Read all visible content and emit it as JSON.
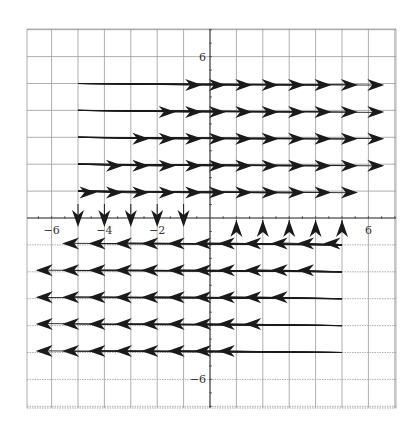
{
  "chart_data": {
    "type": "vector_field",
    "title": "",
    "xlabel": "",
    "ylabel": "",
    "xlim": [
      -7,
      7
    ],
    "ylim": [
      -7,
      7
    ],
    "grid": true,
    "x_tick_labels": [
      {
        "value": -6,
        "label": "−6"
      },
      {
        "value": -4,
        "label": "−4"
      },
      {
        "value": -2,
        "label": "−2"
      },
      {
        "value": 6,
        "label": "6"
      }
    ],
    "y_tick_labels": [
      {
        "value": 6,
        "label": "6"
      },
      {
        "value": -6,
        "label": "−6"
      }
    ],
    "rows_right": [
      {
        "y": 5,
        "tail_x": -5,
        "heads_x": [
          -0.6,
          0.3,
          1.3,
          2.3,
          3.3,
          4.3,
          5.3,
          6.3
        ]
      },
      {
        "y": 4,
        "tail_x": -5,
        "heads_x": [
          -1.6,
          -0.6,
          0.3,
          1.3,
          2.3,
          3.3,
          4.3,
          5.3,
          6.3
        ]
      },
      {
        "y": 3,
        "tail_x": -5,
        "heads_x": [
          -2.6,
          -1.6,
          -0.6,
          0.3,
          1.3,
          2.3,
          3.3,
          4.3,
          5.3,
          6.3
        ]
      },
      {
        "y": 2,
        "tail_x": -5,
        "heads_x": [
          -3.6,
          -2.6,
          -1.6,
          -0.6,
          0.3,
          1.3,
          2.3,
          3.3,
          4.3,
          5.3,
          6.3
        ]
      },
      {
        "y": 1,
        "tail_x": -5,
        "heads_x": [
          -4.6,
          -3.6,
          -2.6,
          -1.6,
          -0.6,
          0.3,
          1.3,
          2.3,
          3.3,
          4.3,
          5.3
        ]
      }
    ],
    "rows_left": [
      {
        "y": -1,
        "tail_x": 5,
        "heads_x": [
          4.6,
          3.6,
          2.6,
          1.6,
          0.6,
          -0.3,
          -1.3,
          -2.3,
          -3.3,
          -4.3,
          -5.3
        ]
      },
      {
        "y": -2,
        "tail_x": 5,
        "heads_x": [
          3.6,
          2.6,
          1.6,
          0.6,
          -0.3,
          -1.3,
          -2.3,
          -3.3,
          -4.3,
          -5.3,
          -6.3
        ]
      },
      {
        "y": -3,
        "tail_x": 5,
        "heads_x": [
          2.6,
          1.6,
          0.6,
          -0.3,
          -1.3,
          -2.3,
          -3.3,
          -4.3,
          -5.3,
          -6.3
        ]
      },
      {
        "y": -4,
        "tail_x": 5,
        "heads_x": [
          1.6,
          0.6,
          -0.3,
          -1.3,
          -2.3,
          -3.3,
          -4.3,
          -5.3,
          -6.3
        ]
      },
      {
        "y": -5,
        "tail_x": 5,
        "heads_x": [
          0.6,
          -0.3,
          -1.3,
          -2.3,
          -3.3,
          -4.3,
          -5.3,
          -6.3
        ]
      }
    ],
    "vertical_down": {
      "y_tail": 0.5,
      "y_tip": -0.2,
      "x": [
        -5,
        -4,
        -3,
        -2,
        -1
      ]
    },
    "vertical_up": {
      "y_tail": -0.5,
      "y_tip": 0.2,
      "x": [
        1,
        2,
        3,
        4,
        5
      ]
    }
  },
  "layout": {
    "plot_left": 27,
    "plot_top": 29,
    "plot_right": 396,
    "plot_bottom": 408,
    "origin_px": [
      210,
      218
    ],
    "px_per_unit_x": 26.4,
    "px_per_unit_y": 26.9,
    "grid_color": "#9a9a9a",
    "axis_color": "#444444",
    "arrow_color": "#1a1a1a"
  }
}
